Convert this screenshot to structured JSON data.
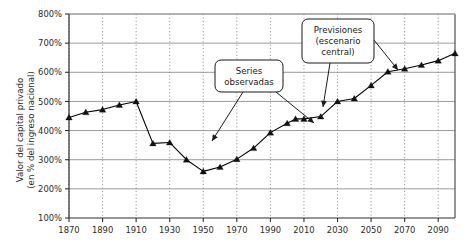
{
  "chart_data": {
    "type": "line",
    "title": "",
    "xlabel": "",
    "ylabel_line1": "Valor del capital privado",
    "ylabel_line2": "(en % del ingreso nacional)",
    "xlim": [
      1870,
      2100
    ],
    "ylim": [
      100,
      800
    ],
    "ytick_labels": [
      "800%",
      "700%",
      "600%",
      "500%",
      "400%",
      "300%",
      "200%",
      "100%"
    ],
    "ytick_values": [
      800,
      700,
      600,
      500,
      400,
      300,
      200,
      100
    ],
    "xtick_labels": [
      "1870",
      "1890",
      "1910",
      "1930",
      "1950",
      "1970",
      "1990",
      "2010",
      "2030",
      "2050",
      "2070",
      "2090"
    ],
    "xtick_values": [
      1870,
      1890,
      1910,
      1930,
      1950,
      1970,
      1990,
      2010,
      2030,
      2050,
      2070,
      2090
    ],
    "grid_horizontal": true,
    "grid_vertical": true,
    "legend_position": "none",
    "marker": "triangle",
    "series": [
      {
        "name": "Valor del capital privado",
        "x": [
          1870,
          1880,
          1890,
          1900,
          1910,
          1920,
          1930,
          1940,
          1950,
          1960,
          1970,
          1980,
          1990,
          2000,
          2005,
          2010,
          2020,
          2030,
          2040,
          2050,
          2060,
          2070,
          2080,
          2090,
          2100
        ],
        "values": [
          445,
          463,
          472,
          488,
          500,
          356,
          359,
          300,
          260,
          275,
          302,
          340,
          393,
          425,
          440,
          440,
          448,
          500,
          510,
          555,
          602,
          612,
          625,
          640,
          665
        ]
      }
    ],
    "annotations": [
      {
        "id": "series-observadas",
        "text_lines": [
          "Series",
          "observadas"
        ],
        "box_x": 215,
        "box_y": 60,
        "box_w": 68,
        "box_h": 32,
        "arrows": [
          {
            "x1": 243,
            "y1": 92,
            "x2": 212,
            "y2": 141
          },
          {
            "x1": 276,
            "y1": 92,
            "x2": 314,
            "y2": 123
          }
        ]
      },
      {
        "id": "previsiones",
        "text_lines": [
          "Previsiones",
          "(escenario",
          "central)"
        ],
        "box_x": 302,
        "box_y": 19,
        "box_w": 72,
        "box_h": 44,
        "arrows": [
          {
            "x1": 330,
            "y1": 63,
            "x2": 323,
            "y2": 107
          },
          {
            "x1": 374,
            "y1": 40,
            "x2": 398,
            "y2": 70
          }
        ]
      }
    ],
    "colors": {
      "line": "#000000",
      "marker": "#111111",
      "grid_horizontal": "#9a9a9a",
      "grid_vertical": "#8d8d8d",
      "axis": "#2f2f2f",
      "text": "#2b2b2b",
      "callout_border": "#1a1a1a",
      "callout_fill": "#ffffff",
      "background": "#ffffff"
    },
    "plot_box": {
      "left": 69,
      "top": 14,
      "right": 455,
      "bottom": 218
    }
  }
}
